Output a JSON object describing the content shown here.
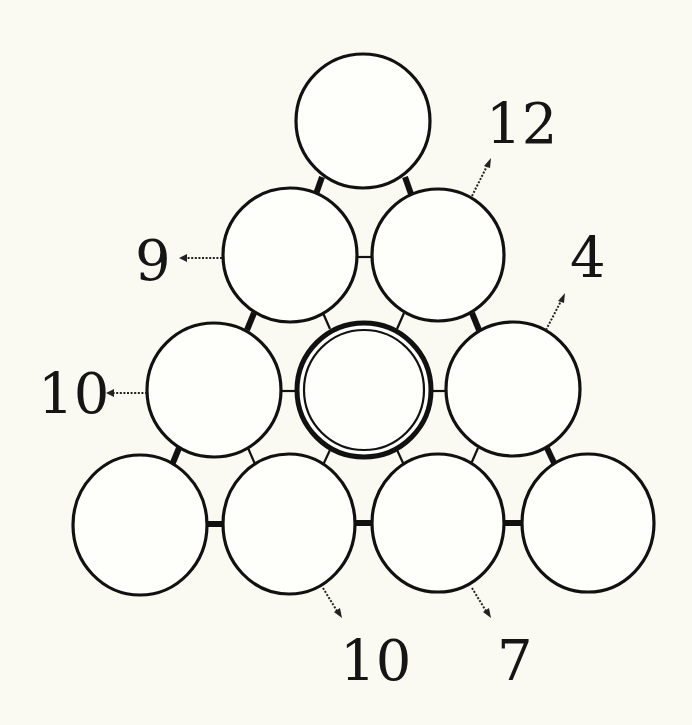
{
  "colors": {
    "background": "#fbfaf2",
    "stroke": "#111111",
    "node_fill": "#fefefb"
  },
  "puzzle": {
    "type": "triangle-circle-number-puzzle",
    "rows": 4,
    "nodes": [
      {
        "id": "r1c1",
        "row": 1,
        "value": ""
      },
      {
        "id": "r2c1",
        "row": 2,
        "value": ""
      },
      {
        "id": "r2c2",
        "row": 2,
        "value": ""
      },
      {
        "id": "r3c1",
        "row": 3,
        "value": ""
      },
      {
        "id": "r3c2",
        "row": 3,
        "value": "",
        "highlighted": true
      },
      {
        "id": "r3c3",
        "row": 3,
        "value": ""
      },
      {
        "id": "r4c1",
        "row": 4,
        "value": ""
      },
      {
        "id": "r4c2",
        "row": 4,
        "value": ""
      },
      {
        "id": "r4c3",
        "row": 4,
        "value": ""
      },
      {
        "id": "r4c4",
        "row": 4,
        "value": ""
      }
    ],
    "clues": [
      {
        "id": "clue-r2c2",
        "target": "r2c2",
        "direction": "up-right",
        "value": "12"
      },
      {
        "id": "clue-r2c1",
        "target": "r2c1",
        "direction": "left",
        "value": "9"
      },
      {
        "id": "clue-r3c3",
        "target": "r3c3",
        "direction": "up-right",
        "value": "4"
      },
      {
        "id": "clue-r3c1",
        "target": "r3c1",
        "direction": "left",
        "value": "10"
      },
      {
        "id": "clue-r4c2",
        "target": "r4c2",
        "direction": "down-right",
        "value": "10"
      },
      {
        "id": "clue-r4c3",
        "target": "r4c3",
        "direction": "down-right",
        "value": "7"
      }
    ]
  },
  "labels": {
    "clue_12": "12",
    "clue_9": "9",
    "clue_4": "4",
    "clue_10_left": "10",
    "clue_10_bottom": "10",
    "clue_7": "7"
  }
}
